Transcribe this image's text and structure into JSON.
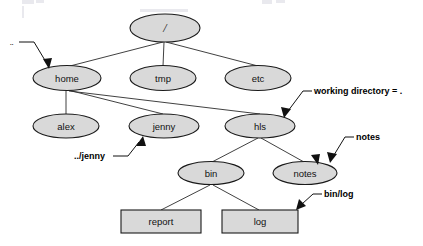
{
  "diagram": {
    "kind": "unix-filesystem-tree",
    "background_color": "#ffffff",
    "node_fill_color": "#d9d9d9",
    "node_stroke_color": "#1a1a1a",
    "edge_color": "#2b2b2b",
    "callout_color": "#000000",
    "nodes": {
      "root": "/",
      "home": "home",
      "tmp": "tmp",
      "etc": "etc",
      "alex": "alex",
      "jenny": "jenny",
      "hls": "hls",
      "bin": "bin",
      "notes": "notes",
      "report": "report",
      "log": "log"
    },
    "callouts": {
      "parent": "..",
      "working_directory": "working directory = .",
      "relative_jenny": "../jenny",
      "relative_notes": "notes",
      "relative_binlog": "bin/log"
    }
  }
}
